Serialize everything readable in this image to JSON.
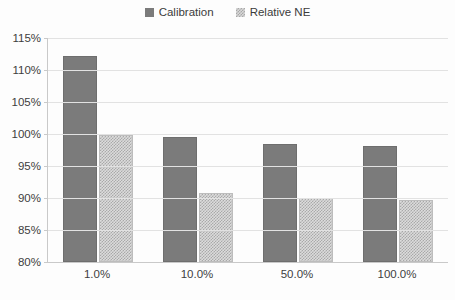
{
  "legend": {
    "position": "top-center",
    "entries": [
      {
        "label": "Calibration",
        "swatch": "calibration-swatch"
      },
      {
        "label": "Relative NE",
        "swatch": "relative-ne-swatch"
      }
    ]
  },
  "axes": {
    "y_ticks": [
      "115%",
      "110%",
      "105%",
      "100%",
      "95%",
      "90%",
      "85%",
      "80%"
    ],
    "x_ticks": [
      "1.0%",
      "10.0%",
      "50.0%",
      "100.0%"
    ]
  },
  "colors": {
    "calibration": "#7b7b7b",
    "relative_ne": "#d8d8d8",
    "gridline": "#e2e2e2",
    "axis": "#c9c9c9",
    "text": "#3d3d3d"
  },
  "chart_data": {
    "type": "bar",
    "title": "",
    "subtitle": "",
    "xlabel": "",
    "ylabel": "",
    "categories": [
      "1.0%",
      "10.0%",
      "50.0%",
      "100.0%"
    ],
    "series": [
      {
        "name": "Calibration",
        "values": [
          112.2,
          99.6,
          98.5,
          98.2
        ]
      },
      {
        "name": "Relative NE",
        "values": [
          99.9,
          90.8,
          90.0,
          89.7
        ]
      }
    ],
    "ylim": [
      80,
      115
    ],
    "ytick_step": 5,
    "ytick_format": "percent",
    "grid": true,
    "legend_position": "top-center"
  }
}
